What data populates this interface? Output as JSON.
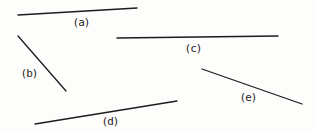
{
  "diagram": {
    "type": "labeled-line-segments",
    "canvas": {
      "width": 314,
      "height": 131,
      "background": "#fdfdfc",
      "stroke_color": "#1c1c1c",
      "stroke_width": 1.3
    },
    "segments": [
      {
        "name": "a",
        "label": "(a)",
        "x1": 18,
        "y1": 15,
        "x2": 137,
        "y2": 8,
        "label_x": 81,
        "label_y": 22
      },
      {
        "name": "b",
        "label": "(b)",
        "x1": 18,
        "y1": 36,
        "x2": 66,
        "y2": 91,
        "label_x": 29,
        "label_y": 73
      },
      {
        "name": "c",
        "label": "(c)",
        "x1": 117,
        "y1": 38,
        "x2": 278,
        "y2": 36,
        "label_x": 193,
        "label_y": 48
      },
      {
        "name": "d",
        "label": "(d)",
        "x1": 35,
        "y1": 124,
        "x2": 177,
        "y2": 101,
        "label_x": 110,
        "label_y": 121
      },
      {
        "name": "e",
        "label": "(e)",
        "x1": 202,
        "y1": 69,
        "x2": 302,
        "y2": 104,
        "label_x": 248,
        "label_y": 97
      }
    ]
  }
}
